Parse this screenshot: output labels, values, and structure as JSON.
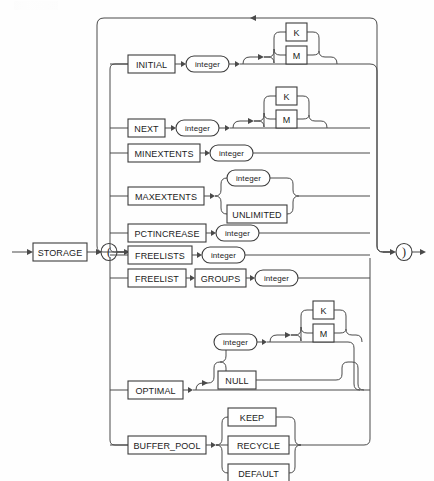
{
  "diagram": {
    "kind": "railroad-syntax-diagram",
    "name": "storage_clause",
    "entry_label": "STORAGE",
    "open_paren": "(",
    "close_paren": ")",
    "line_color": "#4a4a4a",
    "box_stroke": "#3c3c3c",
    "box_fill": "#ffffff",
    "background": "#fefefe",
    "loop_arrow": "left-arrow",
    "options": [
      {
        "id": "initial",
        "keyword": "INITIAL",
        "argument": "integer",
        "argument_type": "nonterminal",
        "suffix_group": {
          "type": "optional-alternatives",
          "items": [
            "K",
            "M"
          ]
        }
      },
      {
        "id": "next",
        "keyword": "NEXT",
        "argument": "integer",
        "argument_type": "nonterminal",
        "suffix_group": {
          "type": "optional-alternatives",
          "items": [
            "K",
            "M"
          ]
        }
      },
      {
        "id": "minextents",
        "keyword": "MINEXTENTS",
        "argument": "integer",
        "argument_type": "nonterminal",
        "suffix_group": null
      },
      {
        "id": "maxextents",
        "keyword": "MAXEXTENTS",
        "argument": null,
        "alternatives": [
          {
            "label": "integer",
            "type": "nonterminal"
          },
          {
            "label": "UNLIMITED",
            "type": "keyword"
          }
        ]
      },
      {
        "id": "pctincrease",
        "keyword": "PCTINCREASE",
        "argument": "integer",
        "argument_type": "nonterminal",
        "suffix_group": null
      },
      {
        "id": "freelists",
        "keyword": "FREELISTS",
        "argument": "integer",
        "argument_type": "nonterminal",
        "suffix_group": null
      },
      {
        "id": "freelist-groups",
        "keyword": "FREELIST",
        "keyword2": "GROUPS",
        "argument": "integer",
        "argument_type": "nonterminal",
        "suffix_group": null
      },
      {
        "id": "optimal",
        "keyword": "OPTIMAL",
        "argument": null,
        "alternatives": [
          {
            "label": "integer",
            "type": "nonterminal"
          },
          {
            "label": "NULL",
            "type": "keyword"
          }
        ],
        "suffix_group": {
          "type": "optional-alternatives",
          "items": [
            "K",
            "M"
          ]
        },
        "skippable": true
      },
      {
        "id": "buffer-pool",
        "keyword": "BUFFER_POOL",
        "argument": null,
        "alternatives": [
          {
            "label": "KEEP",
            "type": "keyword"
          },
          {
            "label": "RECYCLE",
            "type": "keyword"
          },
          {
            "label": "DEFAULT",
            "type": "keyword"
          }
        ]
      }
    ],
    "labels": {
      "storage": "STORAGE",
      "open_paren": "(",
      "close_paren": ")",
      "initial": "INITIAL",
      "next": "NEXT",
      "minextents": "MINEXTENTS",
      "maxextents": "MAXEXTENTS",
      "pctincrease": "PCTINCREASE",
      "freelists": "FREELISTS",
      "freelist": "FREELIST",
      "groups": "GROUPS",
      "optimal": "OPTIMAL",
      "buffer_pool": "BUFFER_POOL",
      "unlimited": "UNLIMITED",
      "null": "NULL",
      "keep": "KEEP",
      "recycle": "RECYCLE",
      "default": "DEFAULT",
      "integer": "integer",
      "k": "K",
      "m": "M"
    }
  }
}
